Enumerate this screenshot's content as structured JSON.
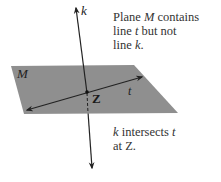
{
  "diagram": {
    "plane": {
      "name": "M",
      "fill": "#8f8f8f"
    },
    "lines": [
      {
        "name": "k",
        "type": "line",
        "description": "vertical line piercing the plane"
      },
      {
        "name": "t",
        "type": "line",
        "description": "line lying in plane M"
      }
    ],
    "point": {
      "name": "Z"
    },
    "captions": {
      "top": [
        "Plane ",
        "M",
        " contains",
        "line ",
        "t",
        " but not",
        "line ",
        "k",
        "."
      ],
      "bottom": [
        "k",
        " intersects ",
        "t",
        "at ",
        "Z",
        "."
      ]
    }
  }
}
